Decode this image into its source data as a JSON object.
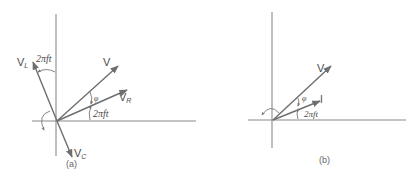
{
  "figure": {
    "panel_a": {
      "caption": "(a)",
      "vectors": [
        {
          "name": "V",
          "subscript": ""
        },
        {
          "name": "V",
          "subscript": "R"
        },
        {
          "name": "V",
          "subscript": "L"
        },
        {
          "name": "V",
          "subscript": "C"
        }
      ],
      "angle_labels": {
        "phi": "φ",
        "omega_t_right": "2πft",
        "omega_t_top": "2πft"
      }
    },
    "panel_b": {
      "caption": "(b)",
      "vectors": [
        {
          "name": "V",
          "subscript": ""
        },
        {
          "name": "I",
          "subscript": ""
        }
      ],
      "angle_labels": {
        "phi": "φ",
        "omega_t": "2πft"
      }
    },
    "colors": {
      "axis": "#8a8a8a",
      "vector": "#6e6e6e",
      "text": "#4a4a4a"
    }
  }
}
